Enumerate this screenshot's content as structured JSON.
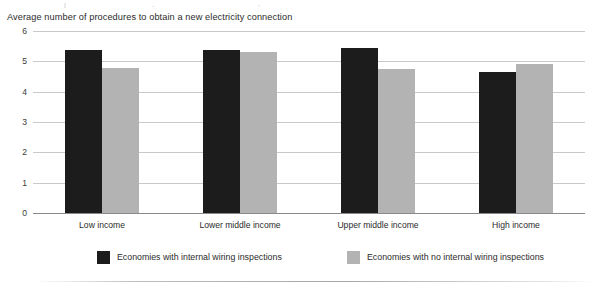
{
  "chart_data": {
    "type": "bar",
    "title": "Average number of procedures to obtain a new electricity connection",
    "xlabel": "",
    "ylabel": "",
    "ylim": [
      0,
      6
    ],
    "yticks": [
      "0",
      "1",
      "2",
      "3",
      "4",
      "5",
      "6"
    ],
    "grid": true,
    "legend_position": "bottom",
    "categories": [
      "Low income",
      "Lower middle income",
      "Upper middle income",
      "High income"
    ],
    "series": [
      {
        "name": "Economies with internal wiring inspections",
        "color": "#1c1c1c",
        "values": [
          5.37,
          5.38,
          5.45,
          4.65
        ]
      },
      {
        "name": "Economies with no internal wiring inspections",
        "color": "#b3b3b3",
        "values": [
          4.77,
          5.3,
          4.75,
          4.9
        ]
      }
    ]
  }
}
